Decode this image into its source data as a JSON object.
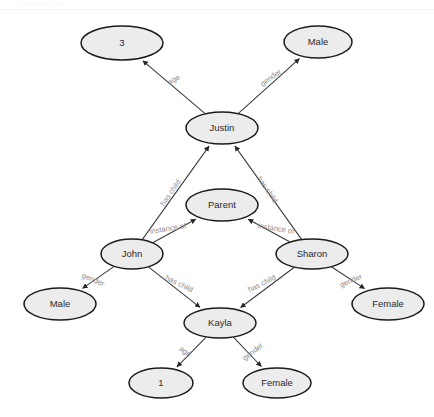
{
  "page": {
    "top_fragment": "...  ...........  .  ......",
    "background": "#ffffff"
  },
  "graph": {
    "title": "Family knowledge graph",
    "type": "directed-graph",
    "node_fill": "#ececec",
    "node_stroke": "#1b1b1b",
    "edge_color": "#3a3a3a",
    "edge_label_color": "#8d8d8d",
    "nodes": [
      {
        "id": "age3",
        "label": "3",
        "cx": 122,
        "cy": 43,
        "rx": 41,
        "ry": 17
      },
      {
        "id": "male_top",
        "label": "Male",
        "cx": 318,
        "cy": 42,
        "rx": 34,
        "ry": 16
      },
      {
        "id": "justin",
        "label": "Justin",
        "cx": 222,
        "cy": 128,
        "rx": 36,
        "ry": 16
      },
      {
        "id": "parent",
        "label": "Parent",
        "cx": 222,
        "cy": 205,
        "rx": 36,
        "ry": 16
      },
      {
        "id": "john",
        "label": "John",
        "cx": 132,
        "cy": 254,
        "rx": 31,
        "ry": 15
      },
      {
        "id": "sharon",
        "label": "Sharon",
        "cx": 312,
        "cy": 254,
        "rx": 36,
        "ry": 15
      },
      {
        "id": "male_bot",
        "label": "Male",
        "cx": 60,
        "cy": 304,
        "rx": 36,
        "ry": 16
      },
      {
        "id": "female_rt",
        "label": "Female",
        "cx": 388,
        "cy": 304,
        "rx": 36,
        "ry": 16
      },
      {
        "id": "kayla",
        "label": "Kayla",
        "cx": 220,
        "cy": 323,
        "rx": 36,
        "ry": 15
      },
      {
        "id": "age1",
        "label": "1",
        "cx": 161,
        "cy": 383,
        "rx": 32,
        "ry": 15
      },
      {
        "id": "female_bt",
        "label": "Female",
        "cx": 277,
        "cy": 383,
        "rx": 34,
        "ry": 15
      }
    ],
    "edges": [
      {
        "id": "e1",
        "from": "justin",
        "to": "age3",
        "label": "age",
        "lx": 174,
        "ly": 80,
        "rot": -31
      },
      {
        "id": "e2",
        "from": "justin",
        "to": "male_top",
        "label": "gender",
        "lx": 271,
        "ly": 78,
        "rot": -36
      },
      {
        "id": "e3",
        "from": "john",
        "to": "justin",
        "label": "has child",
        "lx": 171,
        "ly": 193,
        "rot": -55
      },
      {
        "id": "e4",
        "from": "sharon",
        "to": "justin",
        "label": "has child",
        "lx": 267,
        "ly": 190,
        "rot": 55
      },
      {
        "id": "e5",
        "from": "john",
        "to": "parent",
        "label": "instance of",
        "lx": 168,
        "ly": 229,
        "rot": -9
      },
      {
        "id": "e6",
        "from": "sharon",
        "to": "parent",
        "label": "instance of",
        "lx": 276,
        "ly": 229,
        "rot": 9
      },
      {
        "id": "e7",
        "from": "john",
        "to": "male_bot",
        "label": "gender",
        "lx": 93,
        "ly": 280,
        "rot": 23
      },
      {
        "id": "e8",
        "from": "john",
        "to": "kayla",
        "label": "has child",
        "lx": 179,
        "ly": 284,
        "rot": 26
      },
      {
        "id": "e9",
        "from": "sharon",
        "to": "kayla",
        "label": "has child",
        "lx": 262,
        "ly": 284,
        "rot": -26
      },
      {
        "id": "e10",
        "from": "sharon",
        "to": "female_rt",
        "label": "gender",
        "lx": 351,
        "ly": 281,
        "rot": -23
      },
      {
        "id": "e11",
        "from": "kayla",
        "to": "age1",
        "label": "age",
        "lx": 185,
        "ly": 352,
        "rot": 37
      },
      {
        "id": "e12",
        "from": "kayla",
        "to": "female_bt",
        "label": "gender",
        "lx": 253,
        "ly": 352,
        "rot": -37
      }
    ]
  }
}
